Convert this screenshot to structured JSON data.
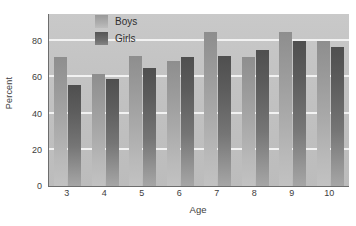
{
  "chart_data": {
    "type": "bar",
    "title": "",
    "subtitle": "",
    "xlabel": "Age",
    "ylabel": "Percent",
    "categories": [
      "3",
      "4",
      "5",
      "6",
      "7",
      "8",
      "9",
      "10"
    ],
    "series": [
      {
        "name": "Boys",
        "values": [
          71,
          62,
          72,
          69,
          85,
          71,
          85,
          80
        ],
        "color": "#a8a8a8"
      },
      {
        "name": "Girls",
        "values": [
          56,
          59,
          65,
          71,
          72,
          75,
          80,
          77
        ],
        "color": "#5f5f5f"
      }
    ],
    "ylim": [
      0,
      95
    ],
    "yticks": [
      0,
      20,
      40,
      60,
      80
    ],
    "ytick_labels": [
      "0",
      "20",
      "40",
      "60",
      "80"
    ],
    "grid": true,
    "grid_color": "#f2f2f2",
    "legend_position": "top-left-inside",
    "plot_background": "#c4c4c4",
    "axis_color": "#6d6d6d"
  },
  "legend": {
    "entries": [
      {
        "label": "Boys",
        "swatch": "boys"
      },
      {
        "label": "Girls",
        "swatch": "girls"
      }
    ]
  },
  "axes": {
    "y_title": "Percent",
    "x_title": "Age"
  }
}
